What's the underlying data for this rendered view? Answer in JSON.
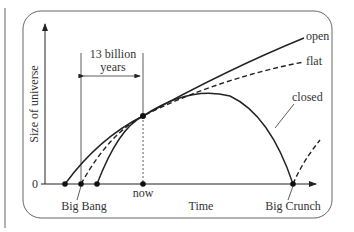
{
  "diagram": {
    "y_axis_label": "Size of universe",
    "x_axis_label": "Time",
    "origin_label": "0",
    "span_label_line1": "13 billion",
    "span_label_line2": "years",
    "marker_now": "now",
    "marker_big_bang": "Big Bang",
    "marker_big_crunch": "Big Crunch",
    "curves": [
      {
        "name": "open",
        "label": "open",
        "style": "solid"
      },
      {
        "name": "flat",
        "label": "flat",
        "style": "dashed"
      },
      {
        "name": "closed",
        "label": "closed",
        "style": "solid"
      }
    ],
    "colors": {
      "ink": "#222222",
      "frame": "#555555",
      "text": "#333333"
    }
  }
}
